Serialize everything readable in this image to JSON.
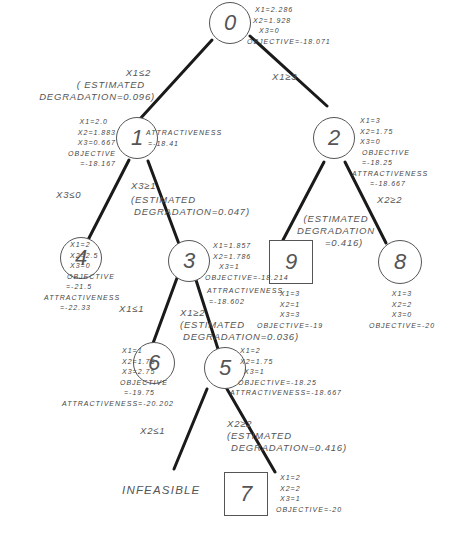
{
  "diagram": {
    "type": "branch-and-bound tree",
    "nodes": [
      {
        "id": "0",
        "label": "0",
        "shape": "circle",
        "info": [
          "X1=2.286",
          "X2=1.928",
          "X3=0",
          "OBJECTIVE=-18.071"
        ]
      },
      {
        "id": "1",
        "label": "1",
        "shape": "circle",
        "info": [
          "X1=2.0",
          "X2=1.883",
          "X3=0.667",
          "OBJECTIVE",
          "=-18.167"
        ],
        "attractiveness": [
          "ATTRACTIVENESS",
          "=-18.41"
        ]
      },
      {
        "id": "2",
        "label": "2",
        "shape": "circle",
        "info": [
          "X1=3",
          "X2=1.75",
          "X3=0",
          "OBJECTIVE",
          "=-18.25",
          "ATTRACTIVENESS",
          "=-18.667"
        ]
      },
      {
        "id": "3",
        "label": "3",
        "shape": "circle",
        "info": [
          "X1=1.857",
          "X2=1.786",
          "X3=1",
          "OBJECTIVE=-18.214",
          "ATTRACTIVENESS",
          "=-18.602"
        ]
      },
      {
        "id": "4",
        "label": "4",
        "shape": "circle",
        "info": [
          "X1=2",
          "X2=2.5",
          "X3=0",
          "OBJECTIVE",
          "=-21.5",
          "ATTRACTIVENESS",
          "=-22.33"
        ]
      },
      {
        "id": "5",
        "label": "5",
        "shape": "circle",
        "info": [
          "X1=2",
          "X2=1.75",
          "X3=1",
          "OBJECTIVE=-18.25",
          "ATTRACTIVENESS=-18.667"
        ]
      },
      {
        "id": "6",
        "label": "6",
        "shape": "circle",
        "info": [
          "X1=1",
          "X2=1.75",
          "X3=2.75",
          "OBJECTIVE",
          "=-19.75",
          "ATTRACTIVENESS=-20.202"
        ]
      },
      {
        "id": "7",
        "label": "7",
        "shape": "square",
        "info": [
          "X1=2",
          "X2=2",
          "X3=1",
          "OBJECTIVE=-20"
        ]
      },
      {
        "id": "8",
        "label": "8",
        "shape": "circle",
        "info": [
          "X1=3",
          "X2=2",
          "X3=0",
          "OBJECTIVE=-20"
        ]
      },
      {
        "id": "9",
        "label": "9",
        "shape": "square",
        "info": [
          "X1=3",
          "X2=1",
          "X3=3",
          "OBJECTIVE=-19"
        ]
      }
    ],
    "edges": [
      {
        "from": "0",
        "to": "1",
        "label": [
          "X1≤2",
          "( ESTIMATED",
          "DEGRADATION=0.096)"
        ]
      },
      {
        "from": "0",
        "to": "2",
        "label": [
          "X1≥3"
        ]
      },
      {
        "from": "1",
        "to": "4",
        "label": [
          "X3≤0"
        ]
      },
      {
        "from": "1",
        "to": "3",
        "label": [
          "X3≥1",
          "(ESTIMATED",
          "DEGRADATION=0.047)"
        ]
      },
      {
        "from": "2",
        "to": "9",
        "label": [
          "(ESTIMATED",
          "DEGRADATION",
          "=0.416)"
        ]
      },
      {
        "from": "2",
        "to": "8",
        "label": [
          "X2≥2"
        ]
      },
      {
        "from": "3",
        "to": "6",
        "label": [
          "X1≤1"
        ]
      },
      {
        "from": "3",
        "to": "5",
        "label": [
          "X1≥2",
          "(ESTIMATED",
          "DEGRADATION=0.036)"
        ]
      },
      {
        "from": "5",
        "to": "infeasible",
        "label": [
          "X2≤1"
        ]
      },
      {
        "from": "5",
        "to": "7",
        "label": [
          "X2≥2",
          "(ESTIMATED",
          "DEGRADATION=0.416)"
        ]
      }
    ],
    "infeasible_label": "INFEASIBLE"
  }
}
